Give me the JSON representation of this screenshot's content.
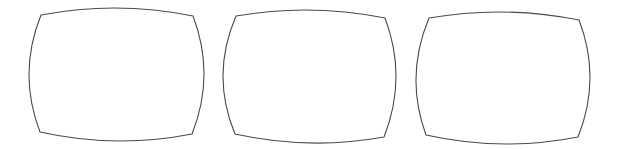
{
  "figure": {
    "background": "#ffffff",
    "stroke_color": "#4a4a4a",
    "shapes": [
      {
        "name": "screen-outline-1",
        "label": "",
        "corners": {
          "tl": [
            41,
            15
          ],
          "tr": [
            193,
            16
          ],
          "br": [
            192,
            134
          ],
          "bl": [
            40,
            132
          ]
        },
        "extremes": {
          "top": 8,
          "bottom": 141,
          "left": 29,
          "right": 204
        }
      },
      {
        "name": "screen-outline-2",
        "label": "",
        "corners": {
          "tl": [
            236,
            16
          ],
          "tr": [
            385,
            18
          ],
          "br": [
            384,
            137
          ],
          "bl": [
            235,
            134
          ]
        },
        "extremes": {
          "top": 10,
          "bottom": 143,
          "left": 223,
          "right": 396
        }
      },
      {
        "name": "screen-outline-3",
        "label": "",
        "corners": {
          "tl": [
            429,
            18
          ],
          "tr": [
            579,
            20
          ],
          "br": [
            578,
            137
          ],
          "bl": [
            426,
            135
          ]
        },
        "extremes": {
          "top": 12,
          "bottom": 144,
          "left": 416,
          "right": 590
        }
      }
    ]
  }
}
